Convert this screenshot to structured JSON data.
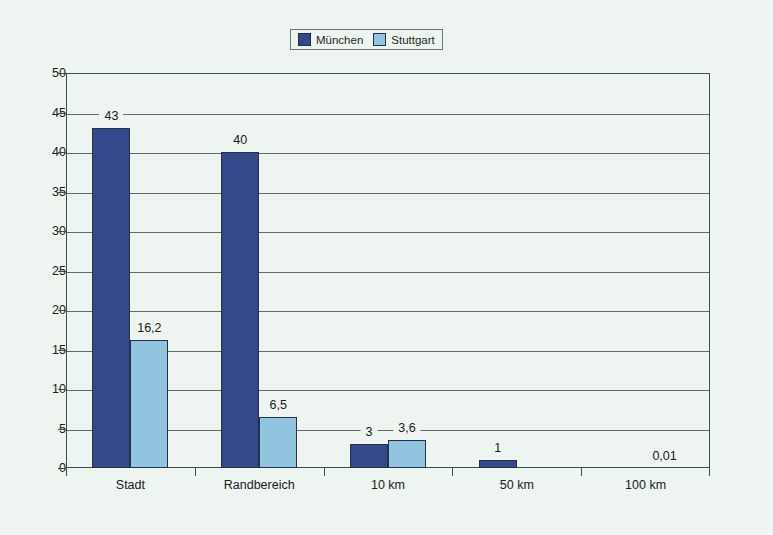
{
  "legend": {
    "position": "top-center",
    "entries": [
      {
        "label": "München",
        "color": "#33498c",
        "swatch": "legend-swatch-muenchen"
      },
      {
        "label": "Stuttgart",
        "color": "#91c5df",
        "swatch": "legend-swatch-stuttgart"
      }
    ]
  },
  "colors": {
    "background": "#eef4ef",
    "axis": "#3d4f49",
    "grid": "#5d6e67",
    "series_muenchen": "#33498c",
    "series_stuttgart": "#91c5df",
    "text": "#16221c"
  },
  "chart_data": {
    "type": "bar",
    "title": "",
    "subtitle": "",
    "xlabel": "",
    "ylabel": "",
    "categories": [
      "Stadt",
      "Randbereich",
      "10 km",
      "50 km",
      "100 km"
    ],
    "series": [
      {
        "name": "München",
        "color": "#33498c",
        "values": [
          43,
          40,
          3,
          1,
          0
        ],
        "labels": [
          "43",
          "40",
          "3",
          "1",
          ""
        ]
      },
      {
        "name": "Stuttgart",
        "color": "#91c5df",
        "values": [
          16.2,
          6.5,
          3.6,
          0,
          0.01
        ],
        "labels": [
          "16,2",
          "6,5",
          "3,6",
          "",
          "0,01"
        ]
      }
    ],
    "ylim": [
      0,
      50
    ],
    "yticks": [
      0,
      5,
      10,
      15,
      20,
      25,
      30,
      35,
      40,
      45,
      50
    ],
    "ytick_labels": [
      "0",
      "5",
      "10",
      "15",
      "20",
      "25",
      "30",
      "35",
      "40",
      "45",
      "50"
    ],
    "grid": true,
    "grid_axis": "y",
    "legend_position": "top-center"
  }
}
